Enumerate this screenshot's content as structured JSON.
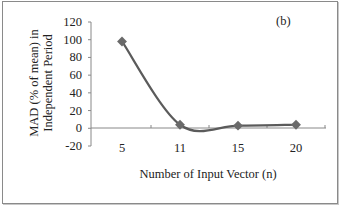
{
  "chart_data": {
    "type": "line",
    "panel_label": "(b)",
    "title": "",
    "xlabel": "Number of Input Vector (n)",
    "ylabel_line1": "MAD (% of mean) in",
    "ylabel_line2": "Independent Period",
    "categories": [
      "5",
      "11",
      "15",
      "20"
    ],
    "series": [
      {
        "name": "MAD",
        "values": [
          98,
          4,
          3,
          4
        ],
        "color": "#5b5b5b"
      }
    ],
    "yticks": [
      "120",
      "100",
      "80",
      "60",
      "40",
      "20",
      "0",
      "-20"
    ],
    "ylim": [
      -20,
      120
    ],
    "grid": false,
    "legend": "none"
  }
}
